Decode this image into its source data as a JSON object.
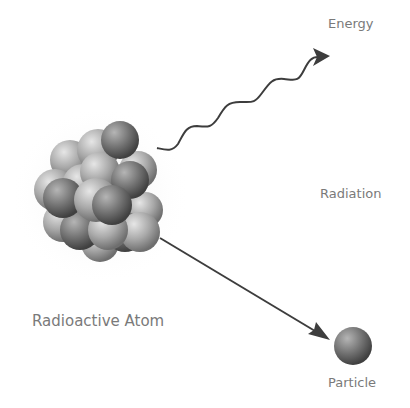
{
  "diagram": {
    "labels": {
      "energy": "Energy",
      "radiation": "Radiation",
      "atom": "Radioactive Atom",
      "particle": "Particle"
    },
    "colors": {
      "background": "#ffffff",
      "text": "#7a7a7a",
      "arrow": "#3d3d3d",
      "sphere_light": "#d0d0d0",
      "sphere_dark": "#555555"
    }
  }
}
